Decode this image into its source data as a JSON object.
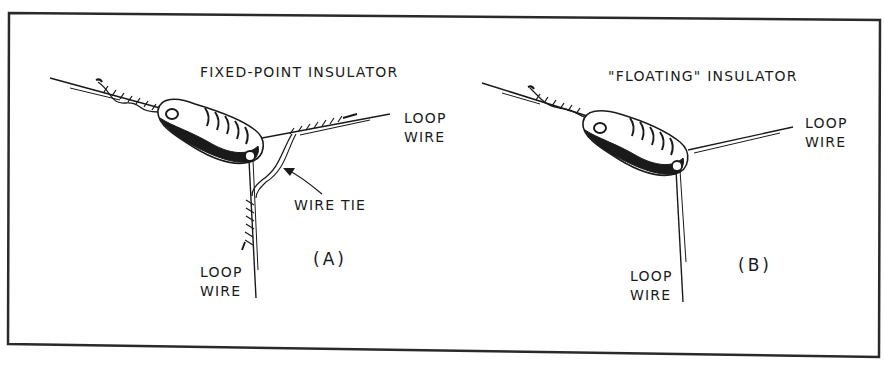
{
  "figure": {
    "panels": [
      {
        "id": "A",
        "title": "FIXED-POINT INSULATOR",
        "panel_label": "(A)",
        "labels": {
          "loop_wire_right_line1": "LOOP",
          "loop_wire_right_line2": "WIRE",
          "wire_tie": "WIRE TIE",
          "loop_wire_bottom_line1": "LOOP",
          "loop_wire_bottom_line2": "WIRE"
        }
      },
      {
        "id": "B",
        "title": "\"FLOATING\" INSULATOR",
        "panel_label": "(B)",
        "labels": {
          "loop_wire_right_line1": "LOOP",
          "loop_wire_right_line2": "WIRE",
          "loop_wire_bottom_line1": "LOOP",
          "loop_wire_bottom_line2": "WIRE"
        }
      }
    ],
    "colors": {
      "ink": "#1a1a1a",
      "background": "#ffffff",
      "border": "#2a2a2a"
    }
  }
}
